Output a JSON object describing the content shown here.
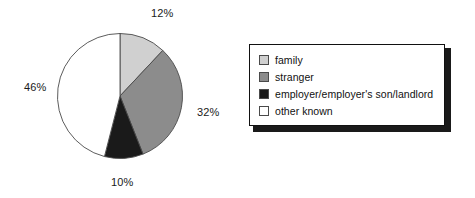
{
  "chart_data": {
    "type": "pie",
    "title": "",
    "categories": [
      "family",
      "stranger",
      "employer/employer's son/landlord",
      "other known"
    ],
    "values": [
      12,
      32,
      10,
      46
    ],
    "value_labels": [
      "12%",
      "32%",
      "10%",
      "46%"
    ],
    "unit": "%",
    "start_angle_deg": 0,
    "direction": "clockwise",
    "legend_position": "right",
    "grid": false,
    "colors": [
      "#d0d0d0",
      "#8c8c8c",
      "#1a1a1a",
      "#ffffff"
    ],
    "outline_color": "#4a4a4a"
  },
  "pie": {
    "labels": {
      "family": "12%",
      "stranger": "32%",
      "employer": "10%",
      "other": "46%"
    }
  },
  "legend": {
    "items": [
      {
        "label": "family",
        "color": "#d0d0d0"
      },
      {
        "label": "stranger",
        "color": "#8c8c8c"
      },
      {
        "label": "employer/employer's son/landlord",
        "color": "#1a1a1a"
      },
      {
        "label": "other known",
        "color": "#ffffff"
      }
    ]
  }
}
